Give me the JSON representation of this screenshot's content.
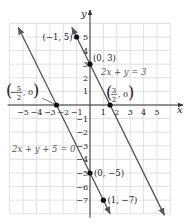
{
  "chart_data": {
    "type": "line",
    "title": "",
    "xlabel": "x",
    "ylabel": "y",
    "xlim": [
      -6,
      6
    ],
    "ylim": [
      -8,
      6
    ],
    "grid": true,
    "x_ticks": [
      -5,
      -4,
      -3,
      -2,
      -1,
      1,
      2,
      3,
      4,
      5
    ],
    "y_ticks": [
      5,
      4,
      3,
      2,
      1,
      -1,
      -2,
      -3,
      -4,
      -5,
      -6,
      -7
    ],
    "series": [
      {
        "name": "2x + y = 3",
        "equation": "y = 3 - 2x",
        "slope": -2,
        "intercept": 3,
        "x_range": [
          -1.35,
          5.55
        ],
        "labeled_points": [
          {
            "x": -1,
            "y": 5,
            "label": "(−1, 5)"
          },
          {
            "x": 0,
            "y": 3,
            "label": "(0, 3)"
          },
          {
            "x": 1.5,
            "y": 0,
            "label_num": "3",
            "label_den": "2",
            "label_rest": ", 0"
          }
        ]
      },
      {
        "name": "2x + y + 5 = 0",
        "equation": "y = -5 - 2x",
        "slope": -2,
        "intercept": -5,
        "x_range": [
          -5.35,
          1.5
        ],
        "labeled_points": [
          {
            "x": -2.5,
            "y": 0,
            "label_num": "5",
            "label_den": "2",
            "label_sign": "−",
            "label_rest": ", 0"
          },
          {
            "x": 0,
            "y": -5,
            "label": "(0, −5)"
          },
          {
            "x": 1,
            "y": -7,
            "label": "(1, −7)"
          }
        ]
      }
    ]
  },
  "labels": {
    "line1_equation": "2x + y = 3",
    "line2_equation": "2x + y + 5 = 0",
    "x_axis": "x",
    "y_axis": "y"
  },
  "colors": {
    "grid": "#d9d9d9",
    "axis": "#333333",
    "line": "#555555",
    "point": "#111111",
    "text": "#222222",
    "equation_text": "#555555"
  }
}
